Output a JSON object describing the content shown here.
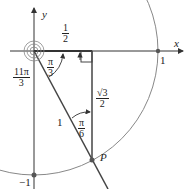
{
  "diagram": {
    "axes": {
      "x_label": "x",
      "y_label": "y"
    },
    "ticks": {
      "one": "1",
      "neg_one": "−1"
    },
    "point_label": "P",
    "hyp_label": "1",
    "fractions": {
      "half": {
        "num": "1",
        "den": "2"
      },
      "pi3": {
        "num": "π",
        "den": "3"
      },
      "pi6": {
        "num": "π",
        "den": "6"
      },
      "sqrt3_2": {
        "num": "√3",
        "den": "2"
      },
      "eleven_pi3": {
        "num": "11π",
        "den": "3"
      }
    },
    "colors": {
      "axis": "#333333",
      "circle": "#777777",
      "line": "#444444"
    }
  }
}
